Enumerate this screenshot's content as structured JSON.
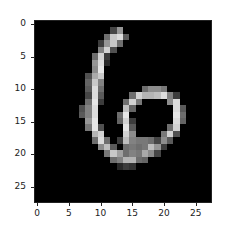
{
  "chart_data": {
    "type": "heatmap",
    "title": "",
    "xlabel": "",
    "ylabel": "",
    "colormap": "gray",
    "xlim": [
      -0.5,
      27.5
    ],
    "ylim": [
      27.5,
      -0.5
    ],
    "xticks": [
      0,
      5,
      10,
      15,
      20,
      25
    ],
    "yticks": [
      0,
      5,
      10,
      15,
      20,
      25
    ],
    "xtick_labels": [
      "0",
      "5",
      "10",
      "15",
      "20",
      "25"
    ],
    "ytick_labels": [
      "0",
      "5",
      "10",
      "15",
      "20",
      "25"
    ],
    "grid": false,
    "shape": [
      28,
      28
    ],
    "nonzero_pixels": {
      "1": {
        "12": 70,
        "13": 150
      },
      "2": {
        "11": 110,
        "12": 200,
        "13": 220,
        "14": 90
      },
      "3": {
        "10": 60,
        "11": 150,
        "12": 200,
        "13": 110
      },
      "4": {
        "10": 130,
        "11": 210,
        "12": 80
      },
      "5": {
        "9": 110,
        "10": 210,
        "11": 60
      },
      "6": {
        "9": 150,
        "10": 220,
        "11": 40
      },
      "7": {
        "9": 140,
        "10": 230
      },
      "8": {
        "8": 80,
        "9": 170,
        "10": 200
      },
      "9": {
        "8": 100,
        "9": 200,
        "10": 130
      },
      "10": {
        "8": 90,
        "9": 220,
        "10": 110,
        "17": 110,
        "18": 140,
        "19": 140,
        "20": 120
      },
      "11": {
        "8": 70,
        "9": 220,
        "10": 90,
        "15": 110,
        "16": 210,
        "17": 180,
        "18": 180,
        "19": 190,
        "20": 220,
        "21": 130,
        "22": 60
      },
      "12": {
        "8": 110,
        "9": 230,
        "10": 60,
        "14": 110,
        "15": 210,
        "16": 120,
        "21": 140,
        "22": 220
      },
      "13": {
        "7": 80,
        "8": 130,
        "9": 220,
        "14": 190,
        "15": 100,
        "22": 220,
        "23": 90
      },
      "14": {
        "7": 90,
        "8": 130,
        "9": 220,
        "13": 110,
        "14": 230,
        "22": 230,
        "23": 110
      },
      "15": {
        "8": 150,
        "9": 230,
        "13": 100,
        "14": 210,
        "15": 60,
        "22": 220,
        "23": 100
      },
      "16": {
        "8": 120,
        "9": 230,
        "10": 80,
        "14": 230,
        "15": 90,
        "21": 110,
        "22": 210
      },
      "17": {
        "9": 180,
        "10": 210,
        "14": 210,
        "15": 140,
        "20": 120,
        "21": 210,
        "22": 80
      },
      "18": {
        "9": 110,
        "10": 220,
        "11": 110,
        "13": 60,
        "14": 190,
        "15": 130,
        "16": 120,
        "17": 120,
        "18": 110,
        "19": 70,
        "20": 140,
        "21": 90
      },
      "19": {
        "10": 140,
        "11": 190,
        "12": 90,
        "14": 110,
        "15": 120,
        "16": 110,
        "17": 120,
        "18": 190,
        "19": 150,
        "20": 60
      },
      "20": {
        "11": 120,
        "12": 200,
        "13": 160,
        "14": 110,
        "15": 130,
        "16": 120,
        "17": 170,
        "18": 140,
        "19": 70
      },
      "21": {
        "12": 110,
        "13": 130,
        "14": 180,
        "15": 180,
        "16": 110,
        "17": 100
      },
      "22": {
        "13": 40,
        "14": 60,
        "15": 50
      }
    }
  }
}
